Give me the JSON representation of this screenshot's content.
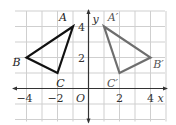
{
  "diagram": {
    "grid": {
      "x_min": -5,
      "x_max": 5,
      "y_min": -2,
      "y_max": 5,
      "step": 1
    },
    "axes": {
      "x_label": "x",
      "y_label": "y",
      "origin_label": "O",
      "x_ticks": [
        {
          "value": -4,
          "label": "−4"
        },
        {
          "value": -2,
          "label": "−2"
        },
        {
          "value": 2,
          "label": "2"
        },
        {
          "value": 4,
          "label": "4"
        }
      ],
      "y_ticks": [
        {
          "value": 4,
          "label": "4"
        },
        {
          "value": 2,
          "label": "2"
        }
      ]
    },
    "triangles": [
      {
        "name": "ABC",
        "color": "#111111",
        "vertices": [
          {
            "label": "A",
            "x": -1,
            "y": 4
          },
          {
            "label": "B",
            "x": -4,
            "y": 2
          },
          {
            "label": "C",
            "x": -2,
            "y": 1
          }
        ]
      },
      {
        "name": "A'B'C'",
        "color": "#6e6e6e",
        "vertices": [
          {
            "label": "A′",
            "x": 1,
            "y": 4
          },
          {
            "label": "B′",
            "x": 4,
            "y": 2
          },
          {
            "label": "C′",
            "x": 2,
            "y": 1
          }
        ]
      }
    ],
    "colors": {
      "grid": "#cfcfcf",
      "axis": "#333333",
      "text": "#333333"
    }
  }
}
